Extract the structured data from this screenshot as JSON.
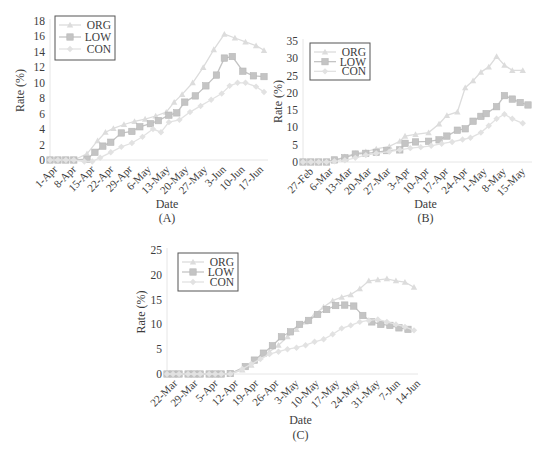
{
  "colors": {
    "ORG": "#dcdcdc",
    "LOW": "#c4c4c4",
    "CON": "#e2e2e2",
    "axis": "#e6e6e6",
    "text": "#3c3c3c",
    "legend_border": "#555555"
  },
  "chart_data": [
    {
      "id": "A",
      "type": "line",
      "caption": "(A)",
      "xlabel": "Date",
      "ylabel": "Rate (%)",
      "ylim": [
        0,
        18
      ],
      "yticks": [
        0,
        2,
        4,
        6,
        8,
        10,
        12,
        14,
        16,
        18
      ],
      "grid": false,
      "legend_position": "upper-left",
      "x_tick_labels": [
        "1-Apr",
        "8-Apr",
        "15-Apr",
        "22-Apr",
        "29-Apr",
        "6-May",
        "13-May",
        "20-May",
        "27-May",
        "3-Jun",
        "10-Jun",
        "17-Jun"
      ],
      "x_days": [
        0,
        1,
        2,
        3,
        4,
        5,
        6,
        7,
        8,
        9,
        10,
        11,
        12,
        13,
        14,
        15,
        16,
        17,
        18,
        19,
        20,
        21,
        22,
        23,
        24,
        25,
        26,
        27,
        28,
        29,
        30,
        31,
        32,
        33,
        34,
        35,
        36,
        37,
        38,
        39,
        40,
        41,
        42,
        43,
        44,
        45,
        46,
        47,
        48,
        49,
        50,
        51,
        52,
        53,
        54,
        55,
        56,
        57,
        58,
        59,
        60,
        61,
        62,
        63,
        64,
        65,
        66,
        67,
        68,
        69,
        70,
        71,
        72,
        73,
        74,
        75,
        76,
        77,
        78,
        79,
        80
      ],
      "series": [
        {
          "name": "ORG",
          "marker": "triangle",
          "points": [
            [
              0,
              0
            ],
            [
              3,
              0
            ],
            [
              6,
              0
            ],
            [
              9,
              0
            ],
            [
              14,
              0.8
            ],
            [
              18,
              2.5
            ],
            [
              21,
              3.6
            ],
            [
              24,
              4.1
            ],
            [
              28,
              4.6
            ],
            [
              32,
              5.0
            ],
            [
              36,
              5.3
            ],
            [
              40,
              5.7
            ],
            [
              44,
              6.2
            ],
            [
              47,
              7.5
            ],
            [
              50,
              8.5
            ],
            [
              54,
              10.0
            ],
            [
              58,
              12.0
            ],
            [
              62,
              14.3
            ],
            [
              66,
              16.3
            ],
            [
              70,
              15.8
            ],
            [
              74,
              15.3
            ],
            [
              78,
              14.8
            ],
            [
              81,
              14.2
            ]
          ]
        },
        {
          "name": "LOW",
          "marker": "square",
          "points": [
            [
              0,
              0
            ],
            [
              3,
              0
            ],
            [
              6,
              0
            ],
            [
              9,
              0
            ],
            [
              14,
              0.1
            ],
            [
              17,
              1.0
            ],
            [
              20,
              1.8
            ],
            [
              23,
              2.3
            ],
            [
              27,
              3.5
            ],
            [
              31,
              3.7
            ],
            [
              34,
              4.3
            ],
            [
              38,
              4.7
            ],
            [
              41,
              5.1
            ],
            [
              45,
              5.8
            ],
            [
              48,
              6.1
            ],
            [
              51,
              7.5
            ],
            [
              55,
              8.3
            ],
            [
              59,
              9.6
            ],
            [
              63,
              11.0
            ],
            [
              66,
              13.2
            ],
            [
              69,
              13.4
            ],
            [
              73,
              11.5
            ],
            [
              77,
              10.9
            ],
            [
              81,
              10.8
            ]
          ]
        },
        {
          "name": "CON",
          "marker": "diamond",
          "points": [
            [
              0,
              0
            ],
            [
              3,
              0
            ],
            [
              6,
              0
            ],
            [
              9,
              0
            ],
            [
              13,
              -0.2
            ],
            [
              16,
              -0.2
            ],
            [
              19,
              0.3
            ],
            [
              23,
              1.0
            ],
            [
              27,
              1.7
            ],
            [
              31,
              2.2
            ],
            [
              35,
              3.0
            ],
            [
              39,
              4.0
            ],
            [
              42,
              3.6
            ],
            [
              45,
              4.9
            ],
            [
              49,
              5.2
            ],
            [
              53,
              6.2
            ],
            [
              57,
              7.0
            ],
            [
              61,
              7.8
            ],
            [
              65,
              8.6
            ],
            [
              68,
              9.6
            ],
            [
              71,
              10.0
            ],
            [
              74,
              10.0
            ],
            [
              78,
              9.5
            ],
            [
              81,
              8.8
            ]
          ]
        }
      ]
    },
    {
      "id": "B",
      "type": "line",
      "caption": "(B)",
      "xlabel": "Date",
      "ylabel": "Rate (%)",
      "ylim": [
        0,
        35
      ],
      "yticks": [
        0,
        5,
        10,
        15,
        20,
        25,
        30,
        35
      ],
      "grid": false,
      "legend_position": "upper-left",
      "x_tick_labels": [
        "27-Feb",
        "6-Mar",
        "13-Mar",
        "20-Mar",
        "27-Mar",
        "3-Apr",
        "10-Apr",
        "17-Apr",
        "24-Apr",
        "1-May",
        "8-May",
        "15-May"
      ],
      "series": [
        {
          "name": "ORG",
          "marker": "triangle",
          "points": [
            [
              0,
              0
            ],
            [
              3,
              0
            ],
            [
              6,
              0
            ],
            [
              9,
              0
            ],
            [
              12,
              0.5
            ],
            [
              16,
              1.5
            ],
            [
              20,
              2.5
            ],
            [
              24,
              3.0
            ],
            [
              28,
              3.8
            ],
            [
              33,
              4.5
            ],
            [
              37,
              6.0
            ],
            [
              39,
              7.5
            ],
            [
              43,
              8.0
            ],
            [
              48,
              8.5
            ],
            [
              52,
              11.0
            ],
            [
              55,
              13.5
            ],
            [
              59,
              14.5
            ],
            [
              62,
              21.5
            ],
            [
              65,
              23.5
            ],
            [
              68,
              26.0
            ],
            [
              71,
              27.5
            ],
            [
              74,
              30.5
            ],
            [
              77,
              28.0
            ],
            [
              80,
              26.5
            ],
            [
              84,
              26.5
            ]
          ]
        },
        {
          "name": "LOW",
          "marker": "square",
          "points": [
            [
              0,
              0
            ],
            [
              3,
              0
            ],
            [
              6,
              0
            ],
            [
              9,
              0
            ],
            [
              12,
              0.6
            ],
            [
              16,
              1.2
            ],
            [
              20,
              2.3
            ],
            [
              24,
              2.5
            ],
            [
              28,
              2.8
            ],
            [
              32,
              3.3
            ],
            [
              37,
              3.5
            ],
            [
              39,
              5.4
            ],
            [
              43,
              5.8
            ],
            [
              48,
              6.0
            ],
            [
              52,
              6.4
            ],
            [
              55,
              7.5
            ],
            [
              59,
              9.2
            ],
            [
              62,
              9.6
            ],
            [
              65,
              11.8
            ],
            [
              68,
              13.2
            ],
            [
              70,
              14.0
            ],
            [
              74,
              16.0
            ],
            [
              77,
              19.2
            ],
            [
              80,
              18.2
            ],
            [
              83,
              17.2
            ],
            [
              86,
              16.5
            ]
          ]
        },
        {
          "name": "CON",
          "marker": "diamond",
          "points": [
            [
              0,
              0
            ],
            [
              3,
              0
            ],
            [
              6,
              0
            ],
            [
              9,
              0
            ],
            [
              12,
              0.2
            ],
            [
              16,
              0.5
            ],
            [
              20,
              1.2
            ],
            [
              24,
              2.0
            ],
            [
              28,
              2.5
            ],
            [
              33,
              3.0
            ],
            [
              37,
              3.5
            ],
            [
              41,
              4.0
            ],
            [
              45,
              4.3
            ],
            [
              49,
              4.7
            ],
            [
              53,
              5.3
            ],
            [
              57,
              5.8
            ],
            [
              61,
              6.5
            ],
            [
              64,
              7.0
            ],
            [
              68,
              8.5
            ],
            [
              71,
              10.5
            ],
            [
              74,
              12.5
            ],
            [
              77,
              13.8
            ],
            [
              80,
              12.5
            ],
            [
              84,
              11.2
            ]
          ]
        }
      ]
    },
    {
      "id": "C",
      "type": "line",
      "caption": "(C)",
      "xlabel": "Date",
      "ylabel": "Rate (%)",
      "ylim": [
        0,
        25
      ],
      "yticks": [
        0,
        5,
        10,
        15,
        20,
        25
      ],
      "grid": false,
      "legend_position": "upper-left",
      "x_tick_labels": [
        "22-Mar",
        "29-Mar",
        "5-Apr",
        "12-Apr",
        "19-Apr",
        "26-Apr",
        "3-May",
        "10-May",
        "17-May",
        "24-May",
        "31-May",
        "7-Jun",
        "14-Jun"
      ],
      "series": [
        {
          "name": "ORG",
          "marker": "triangle",
          "points": [
            [
              0,
              0
            ],
            [
              2,
              0
            ],
            [
              4,
              0
            ],
            [
              7,
              0
            ],
            [
              9,
              0
            ],
            [
              11,
              0
            ],
            [
              14,
              0
            ],
            [
              16,
              0
            ],
            [
              18,
              0
            ],
            [
              21,
              0
            ],
            [
              25,
              0.8
            ],
            [
              28,
              1.8
            ],
            [
              31,
              3.5
            ],
            [
              34,
              4.5
            ],
            [
              37,
              5.8
            ],
            [
              40,
              7.5
            ],
            [
              43,
              9.0
            ],
            [
              46,
              10.5
            ],
            [
              49,
              12.0
            ],
            [
              52,
              13.5
            ],
            [
              55,
              14.8
            ],
            [
              58,
              15.5
            ],
            [
              61,
              16.0
            ],
            [
              64,
              17.2
            ],
            [
              67,
              18.8
            ],
            [
              70,
              19.0
            ],
            [
              73,
              19.2
            ],
            [
              76,
              18.8
            ],
            [
              79,
              18.5
            ],
            [
              82,
              17.5
            ]
          ]
        },
        {
          "name": "LOW",
          "marker": "square",
          "points": [
            [
              0,
              0
            ],
            [
              2,
              0
            ],
            [
              4,
              0
            ],
            [
              7,
              0
            ],
            [
              9,
              0
            ],
            [
              11,
              0
            ],
            [
              14,
              0
            ],
            [
              16,
              0
            ],
            [
              18,
              0
            ],
            [
              21,
              0.1
            ],
            [
              26,
              1.5
            ],
            [
              29,
              2.8
            ],
            [
              32,
              4.2
            ],
            [
              35,
              5.7
            ],
            [
              38,
              7.5
            ],
            [
              41,
              8.5
            ],
            [
              44,
              10.0
            ],
            [
              47,
              10.8
            ],
            [
              50,
              12.0
            ],
            [
              53,
              13.0
            ],
            [
              56,
              13.8
            ],
            [
              59,
              13.9
            ],
            [
              62,
              13.7
            ],
            [
              65,
              11.8
            ],
            [
              68,
              10.5
            ],
            [
              71,
              10.0
            ],
            [
              74,
              9.8
            ],
            [
              77,
              9.3
            ],
            [
              80,
              9.0
            ]
          ]
        },
        {
          "name": "CON",
          "marker": "diamond",
          "points": [
            [
              0,
              0
            ],
            [
              2,
              0
            ],
            [
              4,
              0
            ],
            [
              7,
              0
            ],
            [
              9,
              0
            ],
            [
              11,
              0
            ],
            [
              14,
              0
            ],
            [
              16,
              0
            ],
            [
              18,
              0
            ],
            [
              21,
              0
            ],
            [
              25,
              1.0
            ],
            [
              28,
              2.0
            ],
            [
              31,
              3.0
            ],
            [
              34,
              4.0
            ],
            [
              37,
              4.5
            ],
            [
              40,
              5.0
            ],
            [
              43,
              5.3
            ],
            [
              46,
              5.8
            ],
            [
              49,
              6.5
            ],
            [
              52,
              7.0
            ],
            [
              55,
              8.0
            ],
            [
              58,
              9.2
            ],
            [
              61,
              9.8
            ],
            [
              64,
              10.5
            ],
            [
              67,
              10.8
            ],
            [
              70,
              11.0
            ],
            [
              73,
              10.5
            ],
            [
              76,
              10.0
            ],
            [
              79,
              9.5
            ],
            [
              82,
              8.8
            ]
          ]
        }
      ]
    }
  ]
}
